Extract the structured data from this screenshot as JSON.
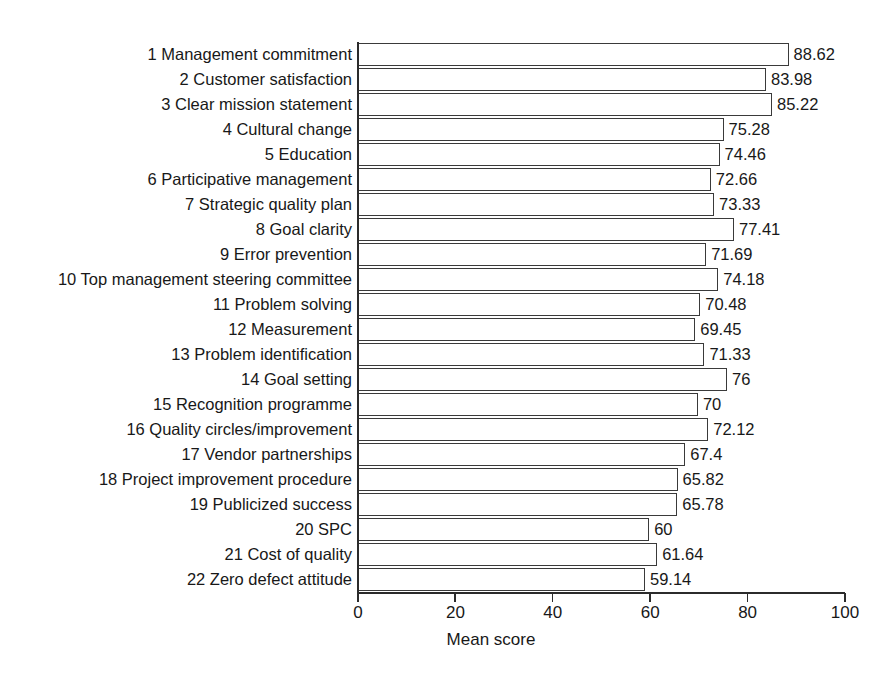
{
  "chart_data": {
    "type": "bar",
    "orientation": "horizontal",
    "title": "",
    "xlabel": "Mean score",
    "ylabel": "",
    "xlim": [
      0,
      100
    ],
    "xticks": [
      "0",
      "20",
      "40",
      "60",
      "80",
      "100"
    ],
    "xtick_values": [
      0,
      20,
      40,
      60,
      80,
      100
    ],
    "grid": false,
    "legend": false,
    "value_labels_shown": true,
    "categories": [
      "1 Management commitment",
      "2 Customer satisfaction",
      "3 Clear mission statement",
      "4 Cultural change",
      "5 Education",
      "6 Participative management",
      "7 Strategic quality plan",
      "8 Goal clarity",
      "9 Error prevention",
      "10 Top management steering committee",
      "11 Problem solving",
      "12 Measurement",
      "13 Problem identification",
      "14 Goal setting",
      "15 Recognition programme",
      "16 Quality circles/improvement",
      "17 Vendor partnerships",
      "18 Project improvement procedure",
      "19 Publicized success",
      "20 SPC",
      "21 Cost of quality",
      "22 Zero defect attitude"
    ],
    "values": [
      88.62,
      83.98,
      85.22,
      75.28,
      74.46,
      72.66,
      73.33,
      77.41,
      71.69,
      74.18,
      70.48,
      69.45,
      71.33,
      76,
      70,
      72.12,
      67.4,
      65.82,
      65.78,
      60,
      61.64,
      59.14
    ],
    "value_labels": [
      "88.62",
      "83.98",
      "85.22",
      "75.28",
      "74.46",
      "72.66",
      "73.33",
      "77.41",
      "71.69",
      "74.18",
      "70.48",
      "69.45",
      "71.33",
      "76",
      "70",
      "72.12",
      "67.4",
      "65.82",
      "65.78",
      "60",
      "61.64",
      "59.14"
    ],
    "colors": {
      "bar_fill": "#ffffff",
      "bar_stroke": "#3a3a3a",
      "axis": "#2b2b2b",
      "text": "#181818",
      "background": "#ffffff"
    }
  }
}
